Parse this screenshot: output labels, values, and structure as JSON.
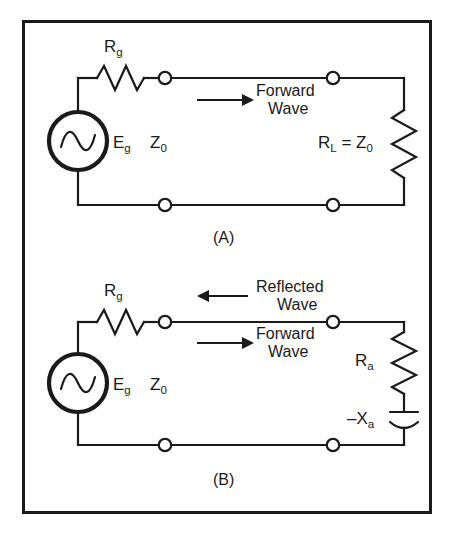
{
  "figure": {
    "background_color": "#ffffff",
    "stroke_color": "#1a1a1a",
    "border": {
      "name": "figure-border",
      "x": 22,
      "y": 20,
      "width": 410,
      "height": 494,
      "stroke_width": 3
    }
  },
  "panels": [
    {
      "id": "A",
      "caption": "(A)",
      "caption_x": 228,
      "caption_y": 243,
      "source": {
        "symbol": "ac-source",
        "label_main": "E",
        "label_sub": "g",
        "cx": 78,
        "cy": 141,
        "r": 29
      },
      "series_resistor": {
        "symbol": "resistor-zigzag",
        "label_main": "R",
        "label_sub": "g",
        "label_x": 104,
        "label_y": 52
      },
      "line_impedance": {
        "label_main": "Z",
        "label_sub": "0",
        "label_x": 150,
        "label_y": 148
      },
      "load": {
        "symbol": "resistor-zigzag-vertical",
        "label_main": "R",
        "label_sub": "L",
        "label_eq": " = Z",
        "label_sub2": "0",
        "label_x": 318,
        "label_y": 148
      },
      "annotations": [
        {
          "name": "forward-wave-annotation",
          "arrow_direction": "right",
          "line1": "Forward",
          "line2": "Wave",
          "arrow_x1": 197,
          "arrow_x2": 248,
          "arrow_y": 100,
          "text_x": 256,
          "text_y1": 96,
          "text_y2": 113
        }
      ],
      "terminals": [
        {
          "name": "terminal-top-left",
          "cx": 165,
          "cy": 78
        },
        {
          "name": "terminal-top-right",
          "cx": 333,
          "cy": 78
        },
        {
          "name": "terminal-bottom-left",
          "cx": 165,
          "cy": 205
        },
        {
          "name": "terminal-bottom-right",
          "cx": 333,
          "cy": 205
        }
      ]
    },
    {
      "id": "B",
      "caption": "(B)",
      "caption_x": 228,
      "caption_y": 485,
      "source": {
        "symbol": "ac-source",
        "label_main": "E",
        "label_sub": "g",
        "cx": 78,
        "cy": 383,
        "r": 29
      },
      "series_resistor": {
        "symbol": "resistor-zigzag",
        "label_main": "R",
        "label_sub": "g",
        "label_x": 104,
        "label_y": 296
      },
      "line_impedance": {
        "label_main": "Z",
        "label_sub": "0",
        "label_x": 150,
        "label_y": 390
      },
      "load_resistor": {
        "symbol": "resistor-zigzag-vertical",
        "label_main": "R",
        "label_sub": "a",
        "label_x": 355,
        "label_y": 366
      },
      "load_capacitor": {
        "symbol": "capacitor-polarized",
        "label_main": "–X",
        "label_sub": "a",
        "label_x": 347,
        "label_y": 424
      },
      "annotations": [
        {
          "name": "reflected-wave-annotation",
          "arrow_direction": "left",
          "line1": "Reflected",
          "line2": "Wave",
          "arrow_x1": 248,
          "arrow_x2": 197,
          "arrow_y": 296,
          "text_x": 256,
          "text_y1": 292,
          "text_y2": 309
        },
        {
          "name": "forward-wave-annotation",
          "arrow_direction": "right",
          "line1": "Forward",
          "line2": "Wave",
          "arrow_x1": 197,
          "arrow_x2": 248,
          "arrow_y": 343,
          "text_x": 256,
          "text_y1": 339,
          "text_y2": 356
        }
      ],
      "terminals": [
        {
          "name": "terminal-top-left",
          "cx": 165,
          "cy": 322
        },
        {
          "name": "terminal-top-right",
          "cx": 333,
          "cy": 322
        },
        {
          "name": "terminal-bottom-left",
          "cx": 165,
          "cy": 445
        },
        {
          "name": "terminal-bottom-right",
          "cx": 333,
          "cy": 445
        }
      ]
    }
  ]
}
